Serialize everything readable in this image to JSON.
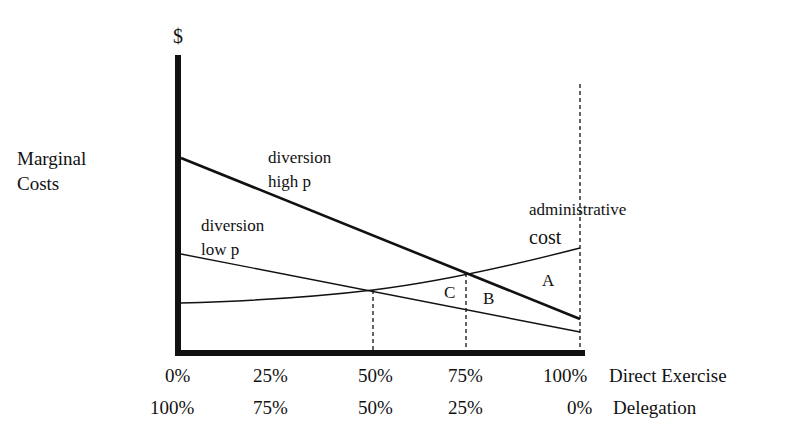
{
  "diagram": {
    "y_axis_symbol": "$",
    "y_axis_label_line1": "Marginal",
    "y_axis_label_line2": "Costs",
    "curves": {
      "high_p_line1": "diversion",
      "high_p_line2": "high p",
      "low_p_line1": "diversion",
      "low_p_line2": "low p",
      "admin_line1": "administrative",
      "admin_line2": "cost"
    },
    "regions": {
      "a": "A",
      "b": "B",
      "c": "C"
    },
    "x_axis_direct": {
      "ticks": [
        "0%",
        "25%",
        "50%",
        "75%",
        "100%"
      ],
      "label": "Direct Exercise"
    },
    "x_axis_delegation": {
      "ticks": [
        "100%",
        "75%",
        "50%",
        "25%",
        "0%"
      ],
      "label": "Delegation"
    }
  },
  "colors": {
    "ink": "#111111",
    "background": "#ffffff"
  }
}
